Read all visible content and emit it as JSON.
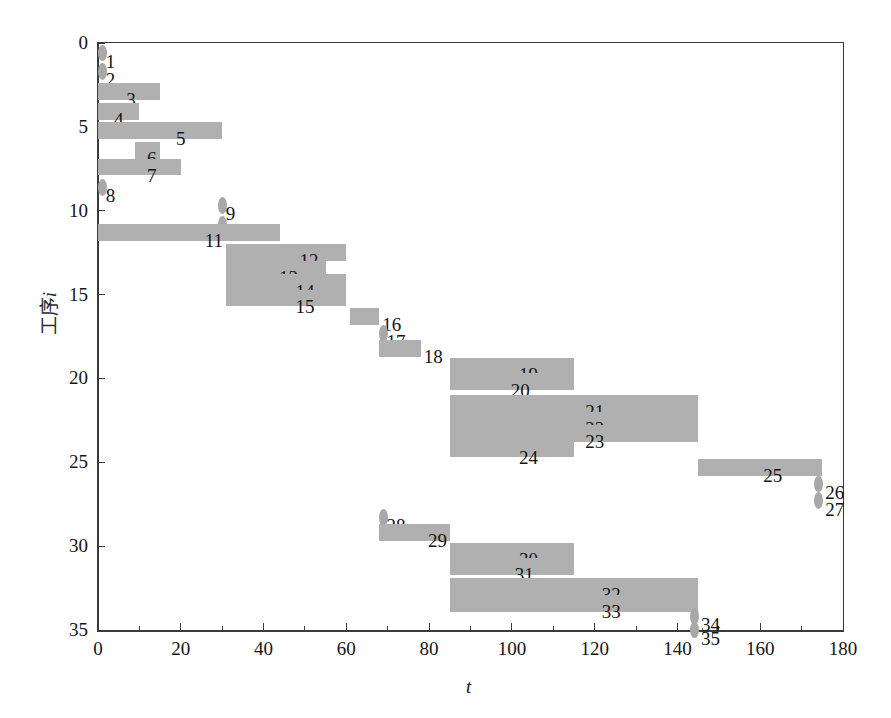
{
  "chart_data": {
    "type": "bar",
    "orientation": "horizontal",
    "title": "",
    "xlabel": "t",
    "ylabel": "工序i",
    "xlim": [
      0,
      180
    ],
    "ylim": [
      35,
      0
    ],
    "xticks": [
      0,
      20,
      40,
      60,
      80,
      100,
      120,
      140,
      160,
      180
    ],
    "xticklabels": [
      "0",
      "20",
      "40",
      "60",
      "80",
      "100",
      "120",
      "140",
      "160",
      "180"
    ],
    "yticks": [
      0,
      5,
      10,
      15,
      20,
      25,
      30,
      35
    ],
    "yticklabels": [
      "0",
      "5",
      "10",
      "15",
      "20",
      "25",
      "30",
      "35"
    ],
    "grid": false,
    "legend": null,
    "bar_color": "#b0b0b0",
    "categories": [
      1,
      2,
      3,
      4,
      5,
      6,
      7,
      8,
      9,
      10,
      11,
      12,
      13,
      14,
      15,
      16,
      17,
      18,
      19,
      20,
      21,
      22,
      23,
      24,
      25,
      26,
      27,
      28,
      29,
      30,
      31,
      32,
      33,
      34,
      35
    ],
    "tasks": [
      {
        "id": 1,
        "label": "1",
        "row": 0.6,
        "start": 0,
        "end": 1.5,
        "label_x": 3
      },
      {
        "id": 2,
        "label": "2",
        "row": 1.7,
        "start": 0,
        "end": 1.5,
        "label_x": 3
      },
      {
        "id": 3,
        "label": "3",
        "row": 2.9,
        "start": 0,
        "end": 15,
        "label_x": 8
      },
      {
        "id": 4,
        "label": "4",
        "row": 4.1,
        "start": 0,
        "end": 10,
        "label_x": 5
      },
      {
        "id": 5,
        "label": "5",
        "row": 5.2,
        "start": 0,
        "end": 30,
        "label_x": 20
      },
      {
        "id": 6,
        "label": "6",
        "row": 6.4,
        "start": 9,
        "end": 15,
        "label_x": 13
      },
      {
        "id": 7,
        "label": "7",
        "row": 7.4,
        "start": 0,
        "end": 20,
        "label_x": 13
      },
      {
        "id": 8,
        "label": "8",
        "row": 8.6,
        "start": 0,
        "end": 1.5,
        "label_x": 3
      },
      {
        "id": 9,
        "label": "9",
        "row": 9.7,
        "start": 29,
        "end": 30.5,
        "label_x": 32
      },
      {
        "id": 10,
        "label": "10",
        "row": 10.8,
        "start": 29,
        "end": 30.5,
        "label_x": 33
      },
      {
        "id": 11,
        "label": "11",
        "row": 11.3,
        "start": 0,
        "end": 44,
        "label_x": 28
      },
      {
        "id": 12,
        "label": "12",
        "row": 12.5,
        "start": 31,
        "end": 60,
        "label_x": 51
      },
      {
        "id": 13,
        "label": "13",
        "row": 13.5,
        "start": 31,
        "end": 55,
        "label_x": 46
      },
      {
        "id": 14,
        "label": "14",
        "row": 14.3,
        "start": 31,
        "end": 60,
        "label_x": 50
      },
      {
        "id": 15,
        "label": "15",
        "row": 15.2,
        "start": 31,
        "end": 60,
        "label_x": 50
      },
      {
        "id": 16,
        "label": "16",
        "row": 16.3,
        "start": 61,
        "end": 68,
        "label_x": 71
      },
      {
        "id": 17,
        "label": "17",
        "row": 17.3,
        "start": 68,
        "end": 69.5,
        "label_x": 72
      },
      {
        "id": 18,
        "label": "18",
        "row": 18.2,
        "start": 68,
        "end": 78,
        "label_x": 81
      },
      {
        "id": 19,
        "label": "19",
        "row": 19.3,
        "start": 85,
        "end": 115,
        "label_x": 104
      },
      {
        "id": 20,
        "label": "20",
        "row": 20.2,
        "start": 85,
        "end": 115,
        "label_x": 102
      },
      {
        "id": 21,
        "label": "21",
        "row": 21.5,
        "start": 85,
        "end": 145,
        "label_x": 120
      },
      {
        "id": 22,
        "label": "22",
        "row": 22.5,
        "start": 85,
        "end": 145,
        "label_x": 120
      },
      {
        "id": 23,
        "label": "23",
        "row": 23.3,
        "start": 85,
        "end": 145,
        "label_x": 120
      },
      {
        "id": 24,
        "label": "24",
        "row": 24.2,
        "start": 85,
        "end": 115,
        "label_x": 104
      },
      {
        "id": 25,
        "label": "25",
        "row": 25.3,
        "start": 145,
        "end": 175,
        "label_x": 163
      },
      {
        "id": 26,
        "label": "26",
        "row": 26.3,
        "start": 173,
        "end": 174.5,
        "label_x": 178
      },
      {
        "id": 27,
        "label": "27",
        "row": 27.3,
        "start": 173,
        "end": 174.5,
        "label_x": 178
      },
      {
        "id": 28,
        "label": "28",
        "row": 28.3,
        "start": 68,
        "end": 69.5,
        "label_x": 72
      },
      {
        "id": 29,
        "label": "29",
        "row": 29.2,
        "start": 68,
        "end": 85,
        "label_x": 82
      },
      {
        "id": 30,
        "label": "30",
        "row": 30.3,
        "start": 85,
        "end": 115,
        "label_x": 104
      },
      {
        "id": 31,
        "label": "31",
        "row": 31.2,
        "start": 85,
        "end": 115,
        "label_x": 103
      },
      {
        "id": 32,
        "label": "32",
        "row": 32.4,
        "start": 85,
        "end": 145,
        "label_x": 124
      },
      {
        "id": 33,
        "label": "33",
        "row": 33.4,
        "start": 85,
        "end": 145,
        "label_x": 124
      },
      {
        "id": 34,
        "label": "34",
        "row": 34.2,
        "start": 143,
        "end": 144.5,
        "label_x": 148
      },
      {
        "id": 35,
        "label": "35",
        "row": 35.0,
        "start": 143,
        "end": 144.5,
        "label_x": 148
      }
    ]
  },
  "axes": {
    "x_title": "t",
    "y_title_text": "工序",
    "y_title_ital": "i"
  }
}
